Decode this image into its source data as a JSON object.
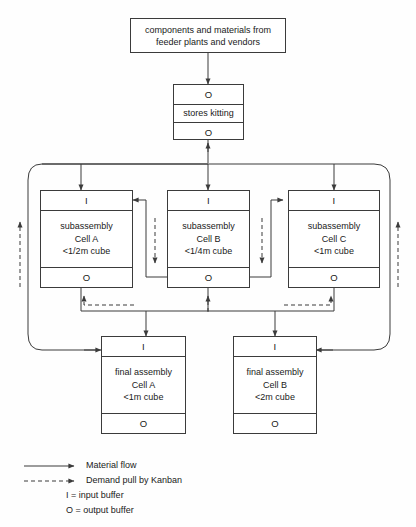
{
  "diagram": {
    "colors": {
      "line": "#3b3b3b",
      "background": "#ffffff",
      "text": "#1a1a1a"
    }
  },
  "source": {
    "line1": "components and materials from",
    "line2": "feeder  plants and vendors"
  },
  "stores": {
    "input_buffer": "O",
    "name": "stores kitting",
    "output_buffer": "O"
  },
  "subassembly": [
    {
      "input_buffer": "I",
      "line1": "subassembly",
      "line2": "Cell A",
      "line3": "<1/2m cube",
      "output_buffer": "O"
    },
    {
      "input_buffer": "I",
      "line1": "subassembly",
      "line2": "Cell B",
      "line3": "<1/4m cube",
      "output_buffer": "O"
    },
    {
      "input_buffer": "I",
      "line1": "subassembly",
      "line2": "Cell C",
      "line3": "<1m cube",
      "output_buffer": "O"
    }
  ],
  "final_assembly": [
    {
      "input_buffer": "I",
      "line1": "final assembly",
      "line2": "Cell A",
      "line3": "<1m cube",
      "output_buffer": "O"
    },
    {
      "input_buffer": "I",
      "line1": "final assembly",
      "line2": "Cell B",
      "line3": "<2m cube",
      "output_buffer": "O"
    }
  ],
  "legend": {
    "material_flow": "Material flow",
    "demand_pull": "Demand pull by Kanban",
    "input_buffer_def": "I = input buffer",
    "output_buffer_def": "O = output buffer"
  }
}
